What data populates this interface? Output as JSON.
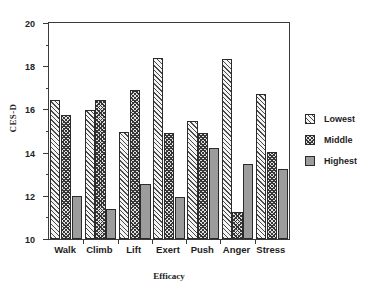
{
  "chart_data": {
    "type": "bar",
    "title": "",
    "xlabel": "Efficacy",
    "ylabel": "CES-D",
    "ylim": [
      10,
      20
    ],
    "ytick_values": [
      10,
      12,
      14,
      16,
      18,
      20
    ],
    "ytick_labels": [
      "10",
      "12",
      "14",
      "16",
      "18",
      "20"
    ],
    "yminor_values": [
      11,
      13,
      15,
      17,
      19
    ],
    "grid": false,
    "legend_position": "right",
    "categories": [
      "Walk",
      "Climb",
      "Lift",
      "Exert",
      "Push",
      "Anger",
      "Stress"
    ],
    "series": [
      {
        "name": "Lowest",
        "pattern": "light-diagonal-hatch",
        "values": [
          16.45,
          15.95,
          14.95,
          18.4,
          15.45,
          18.35,
          16.7
        ]
      },
      {
        "name": "Middle",
        "pattern": "dense-cross-hatch",
        "values": [
          15.75,
          16.45,
          16.9,
          14.9,
          14.9,
          11.25,
          14.05
        ]
      },
      {
        "name": "Highest",
        "pattern": "solid-gray",
        "values": [
          12.0,
          11.4,
          12.55,
          11.95,
          14.2,
          13.45,
          13.25
        ]
      }
    ]
  },
  "top_partial_title": "",
  "legend": {
    "entries": [
      {
        "label": "Lowest"
      },
      {
        "label": "Middle"
      },
      {
        "label": "Highest"
      }
    ]
  },
  "colors": {
    "axis": "#3a3a3a",
    "text": "#1d1d1d",
    "lowest": "#f4f4f4",
    "middle": "#343434",
    "highest": "#9c9c9c",
    "background": "#ffffff"
  }
}
